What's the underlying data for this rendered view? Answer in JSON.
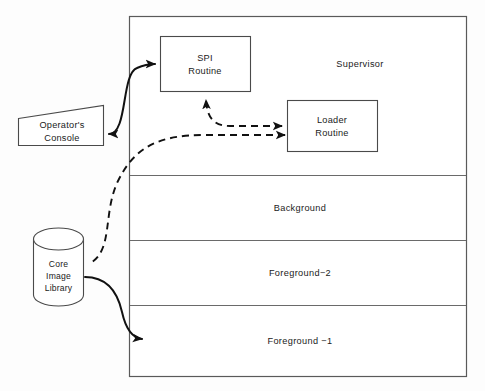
{
  "diagram": {
    "colors": {
      "background": "#fdfdfd",
      "shape_fill": "#ffffff",
      "shape_stroke": "#4a4a4a",
      "container_stroke": "#5a5a5a",
      "arrow": "#111111",
      "text": "#1b1b1b"
    },
    "memory_container": {
      "name": "memory-map-container",
      "regions": [
        {
          "id": "supervisor",
          "label": "Supervisor"
        },
        {
          "id": "background",
          "label": "Background"
        },
        {
          "id": "foreground-2",
          "label": "Foreground−2"
        },
        {
          "id": "foreground-1",
          "label": "Foreground −1"
        }
      ]
    },
    "boxes": [
      {
        "id": "spi-routine",
        "line1": "SPI",
        "line2": "Routine"
      },
      {
        "id": "loader-routine",
        "line1": "Loader",
        "line2": "Routine"
      }
    ],
    "console": {
      "id": "operators-console",
      "line1": "Operator's",
      "line2": "Console"
    },
    "library": {
      "id": "core-image-library",
      "line1": "Core",
      "line2": "Image",
      "line3": "Library"
    },
    "connectors": [
      {
        "id": "console-to-spi",
        "style": "solid",
        "arrowheads": "both",
        "from": "operators-console",
        "to": "spi-routine"
      },
      {
        "id": "loader-to-spi",
        "style": "dashed",
        "arrowheads": "both",
        "from": "loader-routine",
        "to": "spi-routine"
      },
      {
        "id": "loader-to-library",
        "style": "dashed",
        "arrowheads": "start",
        "from": "loader-routine",
        "to": "core-image-library"
      },
      {
        "id": "library-to-foreground-1",
        "style": "solid",
        "arrowheads": "end",
        "from": "core-image-library",
        "to": "foreground-1"
      }
    ]
  }
}
